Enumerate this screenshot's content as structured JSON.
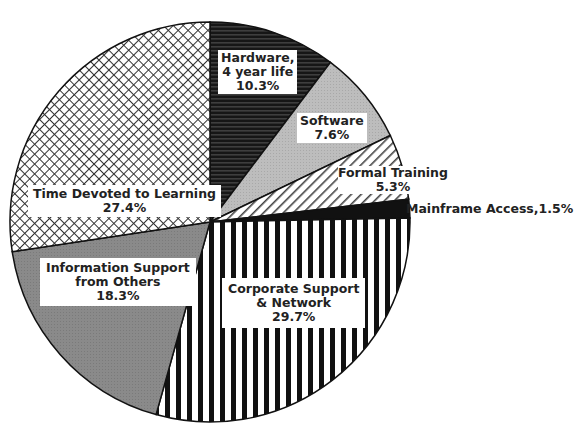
{
  "chart_data": {
    "type": "pie",
    "title": "",
    "start_angle_deg": 0,
    "direction": "clockwise",
    "slices": [
      {
        "label": "Hardware, 4 year life",
        "value": 10.3,
        "display": "10.3%",
        "pattern": "horizontal-lines-dark",
        "color": "#1a1a1a"
      },
      {
        "label": "Software",
        "value": 7.6,
        "display": "7.6%",
        "pattern": "light-gray-dots",
        "color": "#b8b8b8"
      },
      {
        "label": "Formal Training",
        "value": 5.3,
        "display": "5.3%",
        "pattern": "diagonal-hatch",
        "color": "#ffffff"
      },
      {
        "label": "Mainframe Access",
        "value": 1.5,
        "display": "1.5%",
        "pattern": "solid-black",
        "color": "#111111"
      },
      {
        "label": "Corporate Support & Network",
        "value": 29.7,
        "display": "29.7%",
        "pattern": "vertical-stripes",
        "color": "#111111"
      },
      {
        "label": "Information Support from Others",
        "value": 18.3,
        "display": "18.3%",
        "pattern": "dark-gray",
        "color": "#8a8a8a"
      },
      {
        "label": "Time Devoted to Learning",
        "value": 27.4,
        "display": "27.4%",
        "pattern": "crosshatch",
        "color": "#ffffff"
      }
    ]
  },
  "labels": {
    "hardware": {
      "line1": "Hardware,",
      "line2": "4 year life",
      "line3": "10.3%"
    },
    "software": {
      "line1": "Software",
      "line2": "7.6%"
    },
    "formal": {
      "line1": "Formal Training",
      "line2": "5.3%"
    },
    "mainframe": {
      "text": "Mainframe Access,1.5%"
    },
    "corporate": {
      "line1": "Corporate Support",
      "line2": "& Network",
      "line3": "29.7%"
    },
    "information": {
      "line1": "Information Support",
      "line2": "from Others",
      "line3": "18.3%"
    },
    "time": {
      "line1": "Time Devoted to Learning",
      "line2": "27.4%"
    }
  }
}
